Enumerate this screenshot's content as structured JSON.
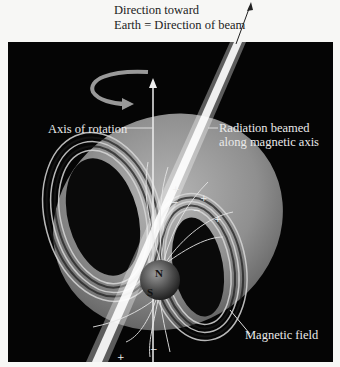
{
  "diagram": {
    "title_line1": "Direction toward",
    "title_line2": "Earth = Direction of beam",
    "labels": {
      "axis_of_rotation": "Axis of rotation",
      "radiation_line1": "Radiation beamed",
      "radiation_line2": "along magnetic axis",
      "magnetic_field": "Magnetic field"
    },
    "poles": {
      "north": "N",
      "south": "S"
    },
    "charges": [
      "+",
      "-",
      "+",
      "-",
      "+",
      "+",
      "+",
      "-"
    ],
    "colors": {
      "background": "#050505",
      "page": "#f7f7f5",
      "field": "#8a8a8a",
      "beam": "#ffffff",
      "text": "#eaeaea"
    }
  }
}
